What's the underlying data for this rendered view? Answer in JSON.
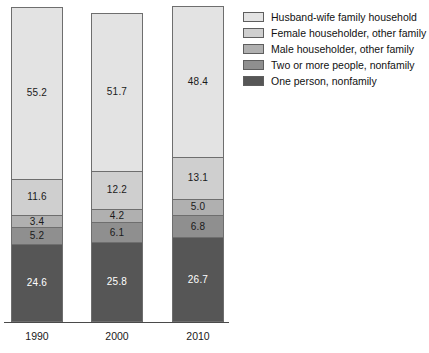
{
  "chart_data": {
    "type": "bar",
    "subtype": "stacked-100-percent-vertical",
    "title": "",
    "subtitle": "",
    "xlabel": "",
    "ylabel": "",
    "ylim": [
      0,
      100
    ],
    "grid": false,
    "legend_position": "right",
    "categories": [
      "1990",
      "2000",
      "2010"
    ],
    "stack_order_top_to_bottom": [
      "Husband-wife family household",
      "Female householder, other family",
      "Male householder, other family",
      "Two or more people, nonfamily",
      "One person, nonfamily"
    ],
    "series": [
      {
        "name": "Husband-wife family household",
        "color": "#e3e3e3",
        "label_color": "#1a1a1a",
        "values": [
          55.2,
          51.7,
          48.4
        ],
        "labels": [
          "55.2",
          "51.7",
          "48.4"
        ]
      },
      {
        "name": "Female householder, other family",
        "color": "#cfcfcf",
        "label_color": "#1a1a1a",
        "values": [
          11.6,
          12.2,
          13.1
        ],
        "labels": [
          "11.6",
          "12.2",
          "13.1"
        ]
      },
      {
        "name": "Male householder, other family",
        "color": "#b0b0b0",
        "label_color": "#1a1a1a",
        "values": [
          3.4,
          4.2,
          5.0
        ],
        "labels": [
          "3.4",
          "4.2",
          "5.0"
        ]
      },
      {
        "name": "Two or more people, nonfamily",
        "color": "#8f8f8f",
        "label_color": "#1a1a1a",
        "values": [
          5.2,
          6.1,
          6.8
        ],
        "labels": [
          "5.2",
          "6.1",
          "6.8"
        ]
      },
      {
        "name": "One person, nonfamily",
        "color": "#565656",
        "label_color": "#ffffff",
        "values": [
          24.6,
          25.8,
          26.7
        ],
        "labels": [
          "24.6",
          "25.8",
          "26.7"
        ]
      }
    ],
    "axis": {
      "baseline_visible": true,
      "y_axis_visible": false
    }
  },
  "legend": {
    "items": [
      {
        "label": "Husband-wife family household",
        "color": "#e3e3e3"
      },
      {
        "label": "Female householder, other family",
        "color": "#cfcfcf"
      },
      {
        "label": "Male householder, other family",
        "color": "#b0b0b0"
      },
      {
        "label": "Two or more people, nonfamily",
        "color": "#8f8f8f"
      },
      {
        "label": "One person, nonfamily",
        "color": "#565656"
      }
    ]
  },
  "x_axis": {
    "ticks": [
      {
        "label": "1990"
      },
      {
        "label": "2000"
      },
      {
        "label": "2010"
      }
    ]
  },
  "bars": [
    {
      "category": "1990",
      "segments": [
        {
          "label": "55.2",
          "value": 55.2,
          "series": "Husband-wife family household",
          "color": "#e3e3e3",
          "text": "dark"
        },
        {
          "label": "11.6",
          "value": 11.6,
          "series": "Female householder, other family",
          "color": "#cfcfcf",
          "text": "dark"
        },
        {
          "label": "3.4",
          "value": 3.4,
          "series": "Male householder, other family",
          "color": "#b0b0b0",
          "text": "dark"
        },
        {
          "label": "5.2",
          "value": 5.2,
          "series": "Two or more people, nonfamily",
          "color": "#8f8f8f",
          "text": "dark"
        },
        {
          "label": "24.6",
          "value": 24.6,
          "series": "One person, nonfamily",
          "color": "#565656",
          "text": "light"
        }
      ]
    },
    {
      "category": "2000",
      "segments": [
        {
          "label": "51.7",
          "value": 51.7,
          "series": "Husband-wife family household",
          "color": "#e3e3e3",
          "text": "dark"
        },
        {
          "label": "12.2",
          "value": 12.2,
          "series": "Female householder, other family",
          "color": "#cfcfcf",
          "text": "dark"
        },
        {
          "label": "4.2",
          "value": 4.2,
          "series": "Male householder, other family",
          "color": "#b0b0b0",
          "text": "dark"
        },
        {
          "label": "6.1",
          "value": 6.1,
          "series": "Two or more people, nonfamily",
          "color": "#8f8f8f",
          "text": "dark"
        },
        {
          "label": "25.8",
          "value": 25.8,
          "series": "One person, nonfamily",
          "color": "#565656",
          "text": "light"
        }
      ]
    },
    {
      "category": "2010",
      "segments": [
        {
          "label": "48.4",
          "value": 48.4,
          "series": "Husband-wife family household",
          "color": "#e3e3e3",
          "text": "dark"
        },
        {
          "label": "13.1",
          "value": 13.1,
          "series": "Female householder, other family",
          "color": "#cfcfcf",
          "text": "dark"
        },
        {
          "label": "5.0",
          "value": 5.0,
          "series": "Male householder, other family",
          "color": "#b0b0b0",
          "text": "dark"
        },
        {
          "label": "6.8",
          "value": 6.8,
          "series": "Two or more people, nonfamily",
          "color": "#8f8f8f",
          "text": "dark"
        },
        {
          "label": "26.7",
          "value": 26.7,
          "series": "One person, nonfamily",
          "color": "#565656",
          "text": "light"
        }
      ]
    }
  ]
}
